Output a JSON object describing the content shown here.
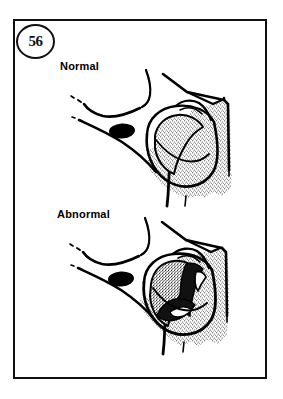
{
  "figure": {
    "number": "56",
    "border_color": "#111111",
    "background_color": "#ffffff",
    "ink_color": "#000000"
  },
  "panels": [
    {
      "id": "normal",
      "label": "Normal",
      "icon": "anatomical-cutaway-diagram"
    },
    {
      "id": "abnormal",
      "label": "Abnormal",
      "icon": "anatomical-cutaway-diagram"
    }
  ],
  "illustration": {
    "style": "black-and-white-line-art",
    "features": [
      "cutaway-block",
      "stippled-tissue-texture",
      "dark-oval-marking",
      "curved-contour-lines"
    ]
  }
}
